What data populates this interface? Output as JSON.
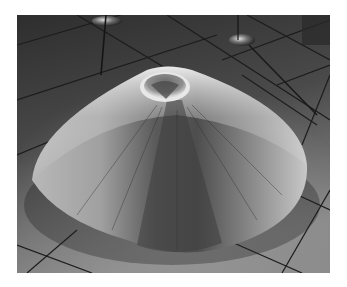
{
  "image": {
    "description": "Black-and-white photograph of a large conical pile of fine powder with a small crater at its peak, sitting on a tiled gallery floor with metal stands in the background",
    "colors": {
      "floor_dark": "#2e2e2e",
      "floor_mid": "#5a5a5a",
      "floor_light": "#8c8c8c",
      "cone_highlight": "#e6e6e6",
      "cone_mid": "#9a9a9a",
      "cone_shadow": "#4a4a4a",
      "grout": "#1a1a1a"
    }
  }
}
